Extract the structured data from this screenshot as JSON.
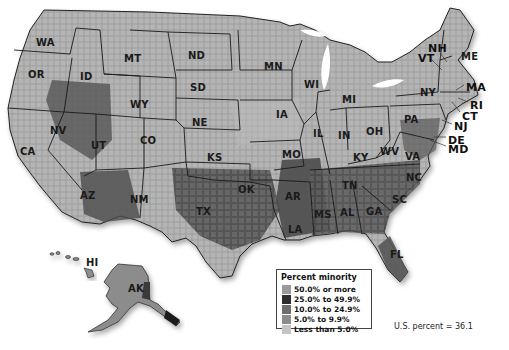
{
  "map": {
    "title": "Percent minority by county",
    "state_labels": [
      {
        "abbr": "WA",
        "x": 36,
        "y": 38
      },
      {
        "abbr": "OR",
        "x": 28,
        "y": 70
      },
      {
        "abbr": "ID",
        "x": 80,
        "y": 72
      },
      {
        "abbr": "MT",
        "x": 124,
        "y": 54
      },
      {
        "abbr": "WY",
        "x": 130,
        "y": 100
      },
      {
        "abbr": "NV",
        "x": 50,
        "y": 126
      },
      {
        "abbr": "UT",
        "x": 91,
        "y": 141
      },
      {
        "abbr": "CA",
        "x": 20,
        "y": 147
      },
      {
        "abbr": "AZ",
        "x": 80,
        "y": 191
      },
      {
        "abbr": "CO",
        "x": 140,
        "y": 136
      },
      {
        "abbr": "NM",
        "x": 130,
        "y": 195
      },
      {
        "abbr": "ND",
        "x": 188,
        "y": 51
      },
      {
        "abbr": "SD",
        "x": 190,
        "y": 83
      },
      {
        "abbr": "NE",
        "x": 192,
        "y": 118
      },
      {
        "abbr": "KS",
        "x": 207,
        "y": 153
      },
      {
        "abbr": "OK",
        "x": 238,
        "y": 185
      },
      {
        "abbr": "TX",
        "x": 196,
        "y": 207
      },
      {
        "abbr": "MN",
        "x": 264,
        "y": 62
      },
      {
        "abbr": "IA",
        "x": 276,
        "y": 110
      },
      {
        "abbr": "MO",
        "x": 282,
        "y": 150
      },
      {
        "abbr": "AR",
        "x": 285,
        "y": 192
      },
      {
        "abbr": "LA",
        "x": 288,
        "y": 225
      },
      {
        "abbr": "WI",
        "x": 304,
        "y": 80
      },
      {
        "abbr": "IL",
        "x": 313,
        "y": 129
      },
      {
        "abbr": "MS",
        "x": 314,
        "y": 210
      },
      {
        "abbr": "AL",
        "x": 340,
        "y": 208
      },
      {
        "abbr": "TN",
        "x": 342,
        "y": 181
      },
      {
        "abbr": "KY",
        "x": 353,
        "y": 153
      },
      {
        "abbr": "IN",
        "x": 338,
        "y": 131
      },
      {
        "abbr": "MI",
        "x": 342,
        "y": 95
      },
      {
        "abbr": "OH",
        "x": 366,
        "y": 127
      },
      {
        "abbr": "WV",
        "x": 380,
        "y": 147
      },
      {
        "abbr": "VA",
        "x": 405,
        "y": 152
      },
      {
        "abbr": "NC",
        "x": 406,
        "y": 173
      },
      {
        "abbr": "SC",
        "x": 392,
        "y": 195
      },
      {
        "abbr": "GA",
        "x": 366,
        "y": 207
      },
      {
        "abbr": "FL",
        "x": 390,
        "y": 250
      },
      {
        "abbr": "PA",
        "x": 404,
        "y": 115
      },
      {
        "abbr": "NY",
        "x": 420,
        "y": 88
      },
      {
        "abbr": "HI",
        "x": 86,
        "y": 258
      },
      {
        "abbr": "AK",
        "x": 128,
        "y": 284
      },
      {
        "abbr": "ME",
        "x": 461,
        "y": 52
      }
    ],
    "callout_labels": [
      {
        "abbr": "NH",
        "x": 428,
        "y": 43
      },
      {
        "abbr": "VT",
        "x": 418,
        "y": 53
      },
      {
        "abbr": "MA",
        "x": 466,
        "y": 82
      },
      {
        "abbr": "RI",
        "x": 470,
        "y": 100
      },
      {
        "abbr": "CT",
        "x": 462,
        "y": 111
      },
      {
        "abbr": "NJ",
        "x": 454,
        "y": 121
      },
      {
        "abbr": "DE",
        "x": 448,
        "y": 135
      },
      {
        "abbr": "MD",
        "x": 448,
        "y": 144
      }
    ]
  },
  "legend": {
    "title": "Percent minority",
    "items": [
      {
        "label": "50.0% or more",
        "color": "#9a9a9a"
      },
      {
        "label": "25.0% to 49.9%",
        "color": "#2e2e2e"
      },
      {
        "label": "10.0% to 24.9%",
        "color": "#6e6e6e"
      },
      {
        "label": "5.0% to 9.9%",
        "color": "#8c8c8c"
      },
      {
        "label": "Less than 5.0%",
        "color": "#c4c4c4"
      }
    ]
  },
  "footnote": "U.S. percent = 36.1"
}
